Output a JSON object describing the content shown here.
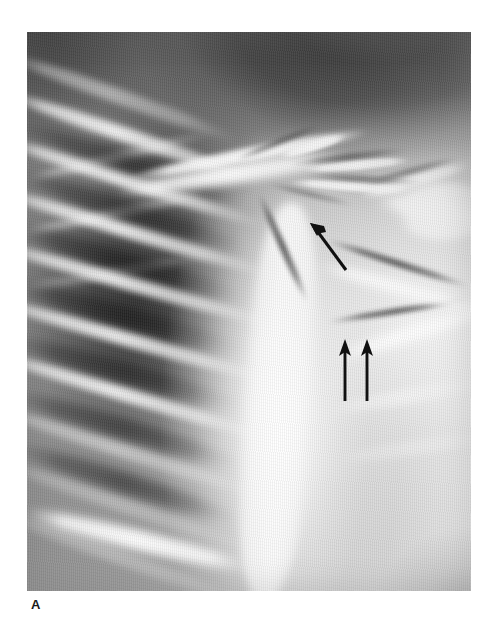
{
  "figure": {
    "label": "A",
    "modality": "chest radiograph",
    "view": "frontal chest x-ray, left hemithorax and right shoulder girdle",
    "plate": {
      "x": 27,
      "y": 32,
      "width": 444,
      "height": 559,
      "background_color": "#8d8d8d",
      "page_background_color": "#ffffff"
    },
    "annotations": [
      {
        "name": "oblique-arrow",
        "shape": "single-headed arrow",
        "direction": "up-left",
        "tip_x": 311,
        "tip_y": 223,
        "tail_x": 346,
        "tail_y": 270,
        "color": "#111111",
        "points_at": "upper mediastinal / supraclavicular opacity"
      },
      {
        "name": "vertical-arrow-left",
        "shape": "single-headed arrow",
        "direction": "up",
        "tip_x": 345,
        "tip_y": 341,
        "tail_x": 345,
        "tail_y": 401,
        "color": "#111111",
        "points_at": "paramediastinal border"
      },
      {
        "name": "vertical-arrow-right",
        "shape": "single-headed arrow",
        "direction": "up",
        "tip_x": 367,
        "tip_y": 341,
        "tail_x": 367,
        "tail_y": 401,
        "color": "#111111",
        "points_at": "paramediastinal border"
      }
    ],
    "regions": [
      {
        "name": "apical-dark-field",
        "description": "very dark supraclavicular / background region, upper right"
      },
      {
        "name": "left-lung-field",
        "description": "dark aerated lung with overlying rib shadows, left side"
      },
      {
        "name": "rib-cage",
        "description": "bright oblique rib bands crossing the lung field"
      },
      {
        "name": "clavicle",
        "description": "bright curved bone band across the upper third"
      },
      {
        "name": "mediastinum",
        "description": "bright dense central column"
      },
      {
        "name": "shoulder-soft-tissue",
        "description": "bright soft tissue of the shoulder and chest wall, right side"
      },
      {
        "name": "lower-right-shadow",
        "description": "gray oblique shading at the lower right corner"
      }
    ]
  }
}
